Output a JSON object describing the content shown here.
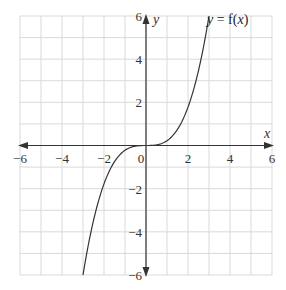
{
  "chart_data": {
    "type": "line",
    "title": "",
    "xlabel": "x",
    "ylabel": "y",
    "xlim": [
      -6,
      6
    ],
    "ylim": [
      -6,
      6
    ],
    "grid": true,
    "grid_step": 1,
    "x_ticks": [
      -6,
      -4,
      -2,
      0,
      2,
      4,
      6
    ],
    "y_ticks": [
      6,
      4,
      2,
      -2,
      -4,
      -6
    ],
    "x_tick_labels": [
      "−6",
      "−4",
      "−2",
      "0",
      "2",
      "4",
      "6"
    ],
    "y_tick_labels": [
      "6",
      "4",
      "2",
      "−2",
      "−4",
      "−6"
    ],
    "series": [
      {
        "name": "y = f(x)",
        "description": "cubic-shaped curve through origin with horizontal tangent at origin",
        "x": [
          -3.0,
          -2.5,
          -2.0,
          -1.5,
          -1.0,
          -0.5,
          0,
          0.5,
          1.0,
          1.5,
          2.0,
          2.5,
          3.0
        ],
        "y": [
          -6.0,
          -3.47,
          -1.78,
          -0.75,
          -0.22,
          -0.03,
          0,
          0.03,
          0.22,
          0.75,
          1.78,
          3.47,
          6.0
        ]
      }
    ],
    "annotations": [
      {
        "text": "y = f(x)",
        "x": 4.2,
        "y": 5.6
      }
    ]
  },
  "labels": {
    "x_axis": "x",
    "y_axis": "y",
    "curve": "y = f(x)",
    "origin": "0"
  },
  "colors": {
    "grid": "#d9d9d9",
    "axis": "#333333",
    "curve": "#333333",
    "background": "#ffffff"
  }
}
